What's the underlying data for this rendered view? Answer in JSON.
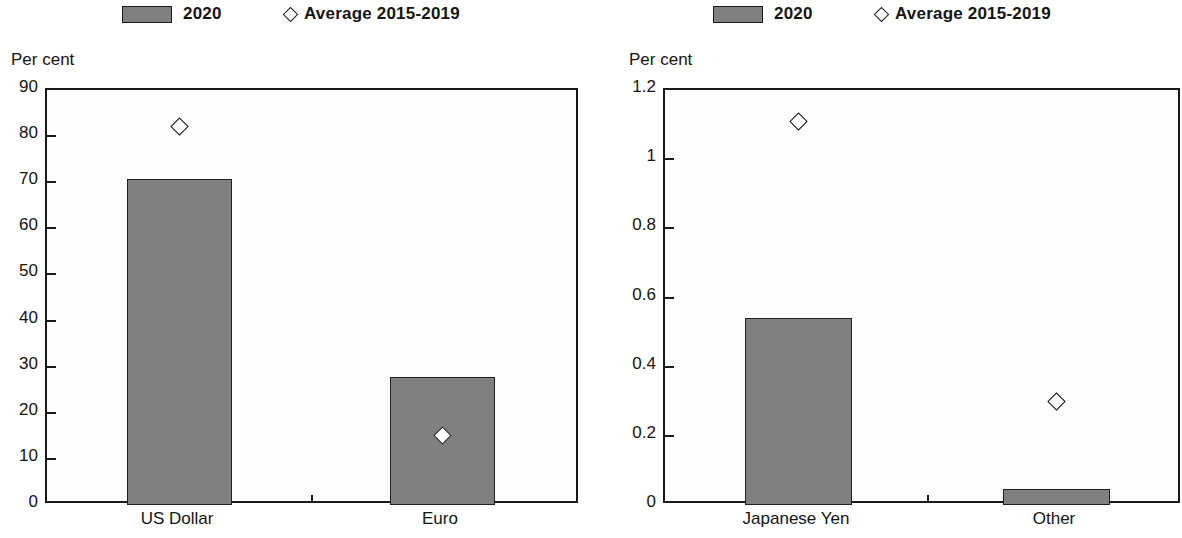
{
  "legend": {
    "series_label": "2020",
    "marker_label": "Average 2015-2019",
    "series_color": "#808080",
    "marker_icon": "diamond-outline-icon"
  },
  "panels": [
    {
      "id": "left",
      "axis_title": "Per cent",
      "ticks": [
        "90",
        "80",
        "70",
        "60",
        "50",
        "40",
        "30",
        "20",
        "10",
        "0"
      ],
      "categories": [
        "US Dollar",
        "Euro"
      ]
    },
    {
      "id": "right",
      "axis_title": "Per cent",
      "ticks": [
        "1.2",
        "1",
        "0.8",
        "0.6",
        "0.4",
        "0.2",
        "0"
      ],
      "categories": [
        "Japanese Yen",
        "Other"
      ]
    }
  ],
  "chart_data": [
    {
      "type": "bar",
      "title": "",
      "xlabel": "",
      "ylabel": "Per cent",
      "ylim": [
        0,
        90
      ],
      "ytick_step": 10,
      "yticks": [
        0,
        10,
        20,
        30,
        40,
        50,
        60,
        70,
        80,
        90
      ],
      "grid": false,
      "legend_position": "top",
      "categories": [
        "US Dollar",
        "Euro"
      ],
      "series": [
        {
          "name": "2020",
          "type": "bar",
          "values": [
            70.8,
            27.8
          ]
        },
        {
          "name": "Average 2015-2019",
          "type": "marker",
          "values": [
            82.0,
            15.0
          ]
        }
      ]
    },
    {
      "type": "bar",
      "title": "",
      "xlabel": "",
      "ylabel": "Per cent",
      "ylim": [
        0,
        1.2
      ],
      "ytick_step": 0.2,
      "yticks": [
        0,
        0.2,
        0.4,
        0.6,
        0.8,
        1,
        1.2
      ],
      "grid": false,
      "legend_position": "top",
      "categories": [
        "Japanese Yen",
        "Other"
      ],
      "series": [
        {
          "name": "2020",
          "type": "bar",
          "values": [
            0.54,
            0.045
          ]
        },
        {
          "name": "Average 2015-2019",
          "type": "marker",
          "values": [
            1.11,
            0.3
          ]
        }
      ]
    }
  ]
}
